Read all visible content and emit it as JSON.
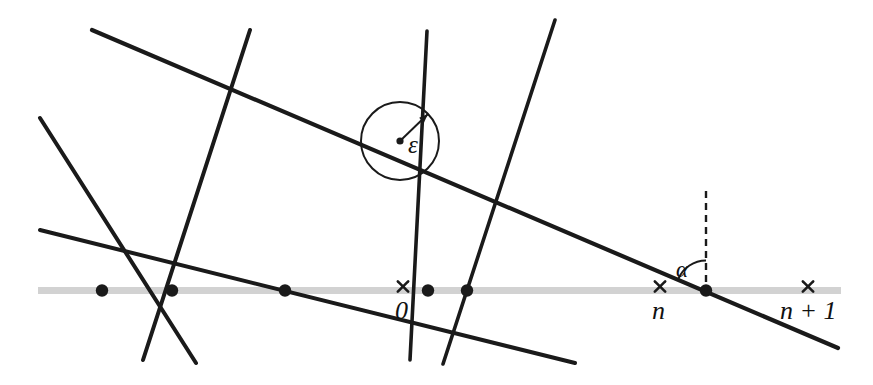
{
  "figure": {
    "kind": "geometric-diagram",
    "width": 873,
    "height": 385,
    "background_color": "#ffffff",
    "ink_color": "#1a1a1a",
    "axis_band_color": "#d2d2d2"
  },
  "labels": {
    "epsilon": "ε",
    "alpha": "α",
    "zero": "0",
    "n": "n",
    "n_plus_1": "n + 1"
  },
  "axis": {
    "name": "real-number-line",
    "y": 290.5,
    "x_start": 38,
    "x_end": 841,
    "thickness": 7,
    "color": "#d2d2d2",
    "tick_marks": [
      {
        "label_key": "zero",
        "x": 403,
        "glyph": "×"
      },
      {
        "label_key": "n",
        "x": 660,
        "glyph": "×"
      },
      {
        "label_key": "n_plus_1",
        "x": 808,
        "glyph": "×"
      }
    ],
    "label_positions": [
      {
        "label_key": "zero",
        "x": 395,
        "y": 298
      },
      {
        "label_key": "n",
        "x": 652,
        "y": 298
      },
      {
        "label_key": "n_plus_1",
        "x": 780,
        "y": 298
      }
    ]
  },
  "lines": [
    {
      "name": "line-long-descending",
      "x1": 92,
      "y1": 30,
      "x2": 838,
      "y2": 348,
      "width": 4.2
    },
    {
      "name": "line-shallow-descending",
      "x1": 40,
      "y1": 230,
      "x2": 575,
      "y2": 363,
      "width": 4.0
    },
    {
      "name": "line-steep-left-falling",
      "x1": 250,
      "y1": 30,
      "x2": 143,
      "y2": 360,
      "width": 4.0
    },
    {
      "name": "line-steep-left-rising",
      "x1": 40,
      "y1": 118,
      "x2": 196,
      "y2": 363,
      "width": 4.0
    },
    {
      "name": "line-steep-mid-falling",
      "x1": 427,
      "y1": 31,
      "x2": 410,
      "y2": 360,
      "width": 3.6
    },
    {
      "name": "line-steep-mid-rising",
      "x1": 555,
      "y1": 20,
      "x2": 443,
      "y2": 364,
      "width": 3.6
    }
  ],
  "dots": [
    {
      "name": "intersection-dot",
      "x": 102,
      "y": 290.5,
      "r": 6.2
    },
    {
      "name": "intersection-dot",
      "x": 172,
      "y": 290.5,
      "r": 6.2
    },
    {
      "name": "intersection-dot",
      "x": 285,
      "y": 290.5,
      "r": 6.2
    },
    {
      "name": "intersection-dot",
      "x": 428,
      "y": 290.5,
      "r": 6.2
    },
    {
      "name": "intersection-dot",
      "x": 467,
      "y": 290.5,
      "r": 6.2
    },
    {
      "name": "intersection-dot",
      "x": 706,
      "y": 290.5,
      "r": 6.2
    }
  ],
  "epsilon_circle": {
    "name": "epsilon-neighbourhood-circle",
    "center_x": 400,
    "center_y": 141,
    "radius": 39,
    "stroke_width": 2.0,
    "center_dot_r": 3.6,
    "arrow_to_x": 428,
    "arrow_to_y": 114,
    "label_x": 408,
    "label_y": 132
  },
  "alpha_angle": {
    "name": "alpha-angle-marker",
    "vertex_x": 706,
    "vertex_y": 290.5,
    "dashed_line_top_y": 191,
    "dash_pattern": "7,5",
    "arc_radius": 30,
    "label_x": 676,
    "label_y": 258
  }
}
